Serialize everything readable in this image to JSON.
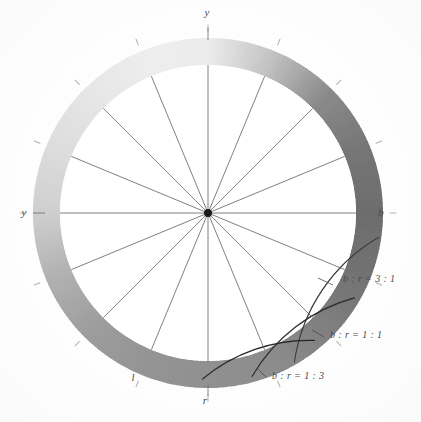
{
  "figure": {
    "background_color": "#ffffff",
    "ink_color": "#4a4a4a"
  },
  "axes": {
    "labels": [
      {
        "name": "top",
        "text": "y",
        "angle_deg": 90,
        "x": 207,
        "y": 16
      },
      {
        "name": "left",
        "text": "y",
        "angle_deg": 180,
        "x": 24,
        "y": 216
      },
      {
        "name": "right",
        "text": "b",
        "angle_deg": 0,
        "x": 381,
        "y": 216
      },
      {
        "name": "bottom",
        "text": "r",
        "angle_deg": 270,
        "x": 205,
        "y": 404
      },
      {
        "name": "lower-left",
        "text": "l",
        "angle_deg": 232,
        "x": 133,
        "y": 381
      }
    ]
  },
  "annotations": [
    {
      "name": "ratio-3-1",
      "text": "b : r = 3 : 1",
      "x": 343,
      "y": 282,
      "leader_from_x": 333,
      "leader_from_y": 285,
      "leader_to_x": 318,
      "leader_to_y": 278
    },
    {
      "name": "ratio-1-1",
      "text": "b : r = 1 : 1",
      "x": 330,
      "y": 338,
      "leader_from_x": 324,
      "leader_from_y": 337,
      "leader_to_x": 312,
      "leader_to_y": 330
    },
    {
      "name": "ratio-1-3",
      "text": "b : r = 1 : 3",
      "x": 272,
      "y": 379,
      "leader_from_x": 266,
      "leader_from_y": 377,
      "leader_to_x": 258,
      "leader_to_y": 369
    }
  ],
  "chart_data": {
    "type": "pie",
    "subtype": "polar-annulus-gradient",
    "center": {
      "x": 208,
      "y": 213
    },
    "inner_radius": 148,
    "outer_radius": 175,
    "spoke_count": 16,
    "spoke_step_deg": 22.5,
    "spoke_radius": 148,
    "hub_radius": 4,
    "grid": false,
    "legend": "none",
    "angle_range_deg": [
      0,
      360
    ],
    "ring_stops": [
      {
        "angle_deg": 0,
        "label": "b",
        "color": "#6d6d6d",
        "lightness": 0.43
      },
      {
        "angle_deg": 22,
        "label": "",
        "color": "#757575",
        "lightness": 0.46
      },
      {
        "angle_deg": 45,
        "label": "",
        "color": "#8a8a8a",
        "lightness": 0.54
      },
      {
        "angle_deg": 68,
        "label": "",
        "color": "#c3c3c3",
        "lightness": 0.76
      },
      {
        "angle_deg": 90,
        "label": "y",
        "color": "#ececec",
        "lightness": 0.93
      },
      {
        "angle_deg": 112,
        "label": "",
        "color": "#ededed",
        "lightness": 0.93
      },
      {
        "angle_deg": 135,
        "label": "",
        "color": "#e6e6e6",
        "lightness": 0.9
      },
      {
        "angle_deg": 158,
        "label": "",
        "color": "#dcdcdc",
        "lightness": 0.86
      },
      {
        "angle_deg": 180,
        "label": "y",
        "color": "#cfcfcf",
        "lightness": 0.81
      },
      {
        "angle_deg": 202,
        "label": "",
        "color": "#b2b2b2",
        "lightness": 0.7
      },
      {
        "angle_deg": 225,
        "label": "",
        "color": "#9d9d9d",
        "lightness": 0.62
      },
      {
        "angle_deg": 248,
        "label": "l",
        "color": "#949494",
        "lightness": 0.58
      },
      {
        "angle_deg": 270,
        "label": "r",
        "color": "#909090",
        "lightness": 0.56
      },
      {
        "angle_deg": 292,
        "label": "",
        "color": "#8d8d8d",
        "lightness": 0.55
      },
      {
        "angle_deg": 315,
        "label": "",
        "color": "#808080",
        "lightness": 0.5
      },
      {
        "angle_deg": 338,
        "label": "",
        "color": "#727272",
        "lightness": 0.45
      },
      {
        "angle_deg": 360,
        "label": "b",
        "color": "#6d6d6d",
        "lightness": 0.43
      }
    ],
    "crescent_arcs": [
      {
        "name": "b:r=3:1",
        "ratio": "3:1",
        "start_angle_deg": 352,
        "end_angle_deg": 300,
        "color": "#3a3a3a"
      },
      {
        "name": "b:r=1:1",
        "ratio": "1:1",
        "start_angle_deg": 330,
        "end_angle_deg": 285,
        "color": "#2e2e2e"
      },
      {
        "name": "b:r=1:3",
        "ratio": "1:3",
        "start_angle_deg": 310,
        "end_angle_deg": 268,
        "color": "#262626"
      }
    ],
    "outer_ticks_deg": [
      0,
      22.5,
      45,
      67.5,
      90,
      112.5,
      135,
      157.5,
      180,
      202.5,
      225,
      247.5,
      270,
      292.5,
      315,
      337.5
    ],
    "xlabel": "",
    "ylabel": ""
  }
}
